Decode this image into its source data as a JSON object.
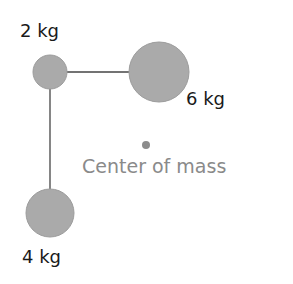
{
  "diagram": {
    "masses": [
      {
        "label": "2 kg",
        "cx": 50,
        "cy": 72,
        "r": 17
      },
      {
        "label": "6 kg",
        "cx": 159,
        "cy": 72,
        "r": 30
      },
      {
        "label": "4 kg",
        "cx": 50,
        "cy": 213,
        "r": 24
      }
    ],
    "center_of_mass": {
      "label": "Center of mass",
      "cx": 146,
      "cy": 145,
      "r": 4
    },
    "colors": {
      "mass_fill": "#aaaaaa",
      "mass_stroke": "#9a9a9a",
      "rod": "#444444",
      "com_dot": "#8c8c8c",
      "com_text": "#8a8a8a"
    }
  }
}
